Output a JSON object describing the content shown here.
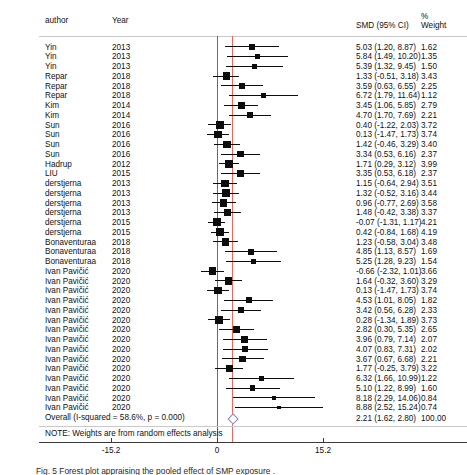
{
  "figure": {
    "type": "forest-plot",
    "columns": {
      "author": "author",
      "year": "Year",
      "smd": "SMD (95% CI)",
      "weight_pct": "%",
      "weight": "Weight"
    },
    "note": "NOTE: Weights are from random effects analysis",
    "caption": "Fig. 5  Forest plot appraising the pooled effect of SMP exposure  .",
    "colors": {
      "null_line": "#6b6b6b",
      "effect_line": "#e8685f",
      "marker": "#0d0d0d",
      "diamond": "#8a7fcf"
    }
  },
  "chart_data": {
    "type": "forest",
    "title": "",
    "xlabel": "",
    "ylabel": "",
    "xlim": [
      -15.2,
      15.2
    ],
    "xticks": [
      -15.2,
      0,
      15.2
    ],
    "xticklabels": [
      "-15.2",
      "0",
      "15.2"
    ],
    "null_value": 0,
    "effect_line_value": 2.21,
    "grid": false,
    "legend": "none",
    "heterogeneity": {
      "i_squared": "58.6%",
      "p_value": "0.000"
    },
    "overall": {
      "label": "Overall  (I-squared = 58.6%, p = 0.000)",
      "estimate": 2.21,
      "ci_low": 1.62,
      "ci_high": 2.8,
      "text": "2.21 (1.62, 2.80)",
      "weight": "100.00"
    },
    "studies": [
      {
        "author": "Yin",
        "year": "2013",
        "est": 5.03,
        "lo": 1.2,
        "hi": 8.87,
        "text": "5.03 (1.20, 8.87)",
        "weight": "1.62"
      },
      {
        "author": "Yin",
        "year": "2013",
        "est": 5.84,
        "lo": 1.49,
        "hi": 10.2,
        "text": "5.84 (1.49, 10.20)",
        "weight": "1.35"
      },
      {
        "author": "Yin",
        "year": "2013",
        "est": 5.39,
        "lo": 1.32,
        "hi": 9.45,
        "text": "5.39 (1.32, 9.45)",
        "weight": "1.50"
      },
      {
        "author": "Repar",
        "year": "2018",
        "est": 1.33,
        "lo": -0.51,
        "hi": 3.18,
        "text": "1.33 (-0.51, 3.18)",
        "weight": "3.43"
      },
      {
        "author": "Repar",
        "year": "2018",
        "est": 3.59,
        "lo": 0.63,
        "hi": 6.55,
        "text": "3.59 (0.63, 6.55)",
        "weight": "2.25"
      },
      {
        "author": "Repar",
        "year": "2018",
        "est": 6.72,
        "lo": 1.79,
        "hi": 11.64,
        "text": "6.72 (1.79, 11.64)",
        "weight": "1.12"
      },
      {
        "author": "Kim",
        "year": "2014",
        "est": 3.45,
        "lo": 1.06,
        "hi": 5.85,
        "text": "3.45 (1.06, 5.85)",
        "weight": "2.79"
      },
      {
        "author": "Kim",
        "year": "2014",
        "est": 4.7,
        "lo": 1.7,
        "hi": 7.69,
        "text": "4.70 (1.70, 7.69)",
        "weight": "2.21"
      },
      {
        "author": "Sun",
        "year": "2016",
        "est": 0.4,
        "lo": -1.22,
        "hi": 2.03,
        "text": "0.40 (-1.22, 2.03)",
        "weight": "3.72"
      },
      {
        "author": "Sun",
        "year": "2016",
        "est": 0.13,
        "lo": -1.47,
        "hi": 1.73,
        "text": "0.13 (-1.47, 1.73)",
        "weight": "3.74"
      },
      {
        "author": "Sun",
        "year": "2016",
        "est": 1.42,
        "lo": -0.46,
        "hi": 3.29,
        "text": "1.42 (-0.46, 3.29)",
        "weight": "3.40"
      },
      {
        "author": "Sun",
        "year": "2016",
        "est": 3.34,
        "lo": 0.53,
        "hi": 6.16,
        "text": "3.34 (0.53, 6.16)",
        "weight": "2.37"
      },
      {
        "author": "Hadrup",
        "year": "2012",
        "est": 1.71,
        "lo": 0.29,
        "hi": 3.12,
        "text": "1.71 (0.29, 3.12)",
        "weight": "3.99"
      },
      {
        "author": "LIU",
        "year": "2015",
        "est": 3.35,
        "lo": 0.53,
        "hi": 6.18,
        "text": "3.35 (0.53, 6.18)",
        "weight": "2.37"
      },
      {
        "author": "derstjerna",
        "year": "2013",
        "est": 1.15,
        "lo": -0.64,
        "hi": 2.94,
        "text": "1.15 (-0.64, 2.94)",
        "weight": "3.51"
      },
      {
        "author": "derstjerna",
        "year": "2013",
        "est": 1.32,
        "lo": -0.52,
        "hi": 3.16,
        "text": "1.32 (-0.52, 3.16)",
        "weight": "3.44"
      },
      {
        "author": "derstjerna",
        "year": "2013",
        "est": 0.96,
        "lo": -0.77,
        "hi": 2.69,
        "text": "0.96 (-0.77, 2.69)",
        "weight": "3.58"
      },
      {
        "author": "derstjerna",
        "year": "2013",
        "est": 1.48,
        "lo": -0.42,
        "hi": 3.38,
        "text": "1.48 (-0.42, 3.38)",
        "weight": "3.37"
      },
      {
        "author": "derstjerna",
        "year": "2015",
        "est": -0.07,
        "lo": -1.31,
        "hi": 1.17,
        "text": "-0.07 (-1.31, 1.17)",
        "weight": "4.21"
      },
      {
        "author": "derstjerna",
        "year": "2015",
        "est": 0.42,
        "lo": -0.84,
        "hi": 1.68,
        "text": "0.42 (-0.84, 1.68)",
        "weight": "4.19"
      },
      {
        "author": "Bonaventuraa",
        "year": "2018",
        "est": 1.23,
        "lo": -0.58,
        "hi": 3.04,
        "text": "1.23 (-0.58, 3.04)",
        "weight": "3.48"
      },
      {
        "author": "Bonaventuraa",
        "year": "2018",
        "est": 4.85,
        "lo": 1.13,
        "hi": 8.57,
        "text": "4.85 (1.13, 8.57)",
        "weight": "1.69"
      },
      {
        "author": "Bonaventuraa",
        "year": "2018",
        "est": 5.25,
        "lo": 1.28,
        "hi": 9.23,
        "text": "5.25 (1.28, 9.23)",
        "weight": "1.54"
      },
      {
        "author": "Ivan Pavičić",
        "year": "2020",
        "est": -0.66,
        "lo": -2.32,
        "hi": 1.01,
        "text": "-0.66 (-2.32, 1.01)",
        "weight": "3.66"
      },
      {
        "author": "Ivan Pavičić",
        "year": "2020",
        "est": 1.64,
        "lo": -0.32,
        "hi": 3.6,
        "text": "1.64 (-0.32, 3.60)",
        "weight": "3.29"
      },
      {
        "author": "Ivan Pavičić",
        "year": "2020",
        "est": 0.13,
        "lo": -1.47,
        "hi": 1.73,
        "text": "0.13 (-1.47, 1.73)",
        "weight": "3.74"
      },
      {
        "author": "Ivan Pavičić",
        "year": "2020",
        "est": 4.53,
        "lo": 1.01,
        "hi": 8.05,
        "text": "4.53 (1.01, 8.05)",
        "weight": "1.82"
      },
      {
        "author": "Ivan Pavičić",
        "year": "2020",
        "est": 3.42,
        "lo": 0.56,
        "hi": 6.28,
        "text": "3.42 (0.56, 6.28)",
        "weight": "2.33"
      },
      {
        "author": "Ivan Pavičić",
        "year": "2020",
        "est": 0.28,
        "lo": -1.34,
        "hi": 1.89,
        "text": "0.28 (-1.34, 1.89)",
        "weight": "3.73"
      },
      {
        "author": "Ivan Pavičić",
        "year": "2020",
        "est": 2.82,
        "lo": 0.3,
        "hi": 5.35,
        "text": "2.82 (0.30, 5.35)",
        "weight": "2.65"
      },
      {
        "author": "Ivan Pavičić",
        "year": "2020",
        "est": 3.96,
        "lo": 0.79,
        "hi": 7.14,
        "text": "3.96 (0.79, 7.14)",
        "weight": "2.07"
      },
      {
        "author": "Ivan Pavičić",
        "year": "2020",
        "est": 4.07,
        "lo": 0.83,
        "hi": 7.31,
        "text": "4.07 (0.83, 7.31)",
        "weight": "2.02"
      },
      {
        "author": "Ivan Pavičić",
        "year": "2020",
        "est": 3.67,
        "lo": 0.67,
        "hi": 6.68,
        "text": "3.67 (0.67, 6.68)",
        "weight": "2.21"
      },
      {
        "author": "Ivan Pavičić",
        "year": "2020",
        "est": 1.77,
        "lo": -0.25,
        "hi": 3.79,
        "text": "1.77 (-0.25, 3.79)",
        "weight": "3.22"
      },
      {
        "author": "Ivan Pavičić",
        "year": "2020",
        "est": 6.32,
        "lo": 1.66,
        "hi": 10.99,
        "text": "6.32 (1.66, 10.99)",
        "weight": "1.22"
      },
      {
        "author": "Ivan Pavičić",
        "year": "2020",
        "est": 5.1,
        "lo": 1.22,
        "hi": 8.99,
        "text": "5.10 (1.22, 8.99)",
        "weight": "1.60"
      },
      {
        "author": "Ivan Pavičić",
        "year": "2020",
        "est": 8.18,
        "lo": 2.29,
        "hi": 14.06,
        "text": "8.18 (2.29, 14.06)",
        "weight": "0.84"
      },
      {
        "author": "Ivan Pavičić",
        "year": "2020",
        "est": 8.88,
        "lo": 2.52,
        "hi": 15.24,
        "text": "8.88 (2.52, 15.24)",
        "weight": "0.74"
      }
    ]
  }
}
